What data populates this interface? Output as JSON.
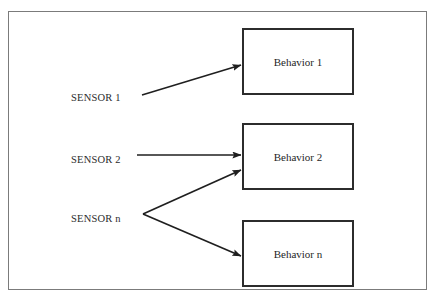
{
  "page": {
    "page_number_mark": "",
    "background_color": "#ffffff",
    "frame_color": "#7b7b7b"
  },
  "diagram": {
    "title": "",
    "type": "flow-diagram",
    "box_border_color": "#2c2c2c",
    "arrow_color": "#1f1f1f",
    "sensors": [
      {
        "id": "sensor-1",
        "label": "SENSOR 1",
        "x": 70,
        "y": 96
      },
      {
        "id": "sensor-2",
        "label": "SENSOR 2",
        "x": 70,
        "y": 158
      },
      {
        "id": "sensor-n",
        "label": "SENSOR n",
        "x": 70,
        "y": 217
      }
    ],
    "behaviors": [
      {
        "id": "behavior-1",
        "label": "Behavior 1",
        "x": 241,
        "y": 27,
        "w": 112,
        "h": 67
      },
      {
        "id": "behavior-2",
        "label": "Behavior 2",
        "x": 241,
        "y": 122,
        "w": 112,
        "h": 67
      },
      {
        "id": "behavior-n",
        "label": "Behavior n",
        "x": 241,
        "y": 219,
        "w": 112,
        "h": 67
      }
    ],
    "connections": [
      {
        "id": "sensor-1-to-behavior-1",
        "from": "sensor-1",
        "to": "behavior-1"
      },
      {
        "id": "sensor-2-to-behavior-2",
        "from": "sensor-2",
        "to": "behavior-2"
      },
      {
        "id": "sensor-n-to-behavior-2",
        "from": "sensor-n",
        "to": "behavior-2"
      },
      {
        "id": "sensor-n-to-behavior-n",
        "from": "sensor-n",
        "to": "behavior-n"
      }
    ]
  }
}
